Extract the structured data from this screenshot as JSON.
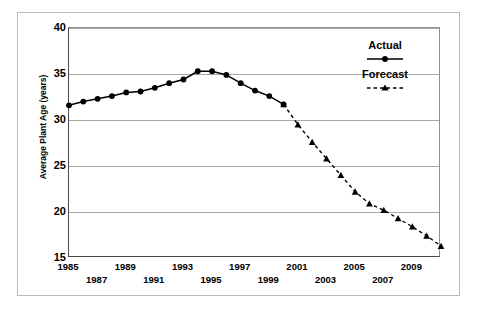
{
  "chart_data": {
    "type": "line",
    "title": "",
    "xlabel": "",
    "ylabel": "Average Plant Age (years)",
    "ylim": [
      15,
      40
    ],
    "xlim": [
      1985,
      2011
    ],
    "yticks": [
      15,
      20,
      25,
      30,
      35,
      40
    ],
    "ytick_labels": [
      "15",
      "20",
      "25",
      "30",
      "35",
      "40"
    ],
    "xticks": [
      1985,
      1987,
      1989,
      1991,
      1993,
      1995,
      1997,
      1999,
      2001,
      2003,
      2005,
      2007,
      2009
    ],
    "xtick_labels": [
      "1985",
      "1987",
      "1989",
      "1991",
      "1993",
      "1995",
      "1997",
      "1999",
      "2001",
      "2003",
      "2005",
      "2007",
      "2009"
    ],
    "grid": true,
    "legend_position": "upper right",
    "series": [
      {
        "name": "Actual",
        "marker": "circle",
        "linestyle": "solid",
        "color": "#000000",
        "x": [
          1985,
          1986,
          1987,
          1988,
          1989,
          1990,
          1991,
          1992,
          1993,
          1994,
          1995,
          1996,
          1997,
          1998,
          1999,
          2000
        ],
        "values": [
          31.6,
          32.0,
          32.3,
          32.6,
          33.0,
          33.1,
          33.5,
          34.0,
          34.4,
          35.3,
          35.3,
          34.9,
          34.0,
          33.2,
          32.6,
          31.7
        ]
      },
      {
        "name": "Forecast",
        "marker": "triangle",
        "linestyle": "dashed",
        "color": "#000000",
        "x": [
          2000,
          2001,
          2002,
          2003,
          2004,
          2005,
          2006,
          2007,
          2008,
          2009,
          2010,
          2011
        ],
        "values": [
          31.7,
          29.5,
          27.6,
          25.8,
          24.0,
          22.2,
          20.9,
          20.2,
          19.3,
          18.4,
          17.4,
          16.3
        ]
      }
    ]
  },
  "legend": {
    "actual_label": "Actual",
    "forecast_label": "Forecast"
  },
  "axis": {
    "y_title": "Average Plant Age (years)"
  }
}
